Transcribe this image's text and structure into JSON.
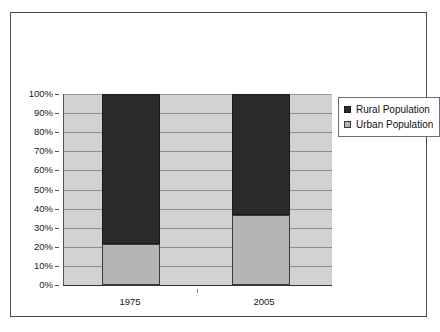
{
  "chart_data": {
    "type": "bar",
    "subtype": "100% stacked bar",
    "title": "",
    "subtitle": "",
    "xlabel": "",
    "ylabel": "",
    "categories": [
      "1975",
      "2005"
    ],
    "series": [
      {
        "name": "Rural Population",
        "color": "#2b2b2b",
        "values": [
          78.5,
          63.4
        ]
      },
      {
        "name": "Urban Population",
        "color": "#b5b5b5",
        "values": [
          21.5,
          36.6
        ]
      }
    ],
    "stack_order_bottom_to_top": [
      "Urban Population",
      "Rural Population"
    ],
    "ylim": [
      0,
      100
    ],
    "ytick_step": 10,
    "ytick_labels": [
      "0%",
      "10%",
      "20%",
      "30%",
      "40%",
      "50%",
      "60%",
      "70%",
      "80%",
      "90%",
      "100%"
    ],
    "ytick_values": [
      0,
      10,
      20,
      30,
      40,
      50,
      60,
      70,
      80,
      90,
      100
    ],
    "grid": true,
    "grid_axis": "y",
    "legend": true,
    "legend_position": "right",
    "legend_entries": [
      "Rural Population",
      "Urban Population"
    ],
    "plot_background": "#d2d2d2",
    "frame_border_color": "#4a4a52"
  },
  "axes": {
    "y_ticks": [
      {
        "label": "100%",
        "value": 100
      },
      {
        "label": "90%",
        "value": 90
      },
      {
        "label": "80%",
        "value": 80
      },
      {
        "label": "70%",
        "value": 70
      },
      {
        "label": "60%",
        "value": 60
      },
      {
        "label": "50%",
        "value": 50
      },
      {
        "label": "40%",
        "value": 40
      },
      {
        "label": "30%",
        "value": 30
      },
      {
        "label": "20%",
        "value": 20
      },
      {
        "label": "10%",
        "value": 10
      },
      {
        "label": "0%",
        "value": 0
      }
    ],
    "x_ticks": [
      {
        "label": "1975"
      },
      {
        "label": "2005"
      }
    ]
  },
  "legend": {
    "items": [
      {
        "label": "Rural Population",
        "swatch": "rural-swatch-icon",
        "color": "#2b2b2b"
      },
      {
        "label": "Urban Population",
        "swatch": "urban-swatch-icon",
        "color": "#b5b5b5"
      }
    ]
  }
}
